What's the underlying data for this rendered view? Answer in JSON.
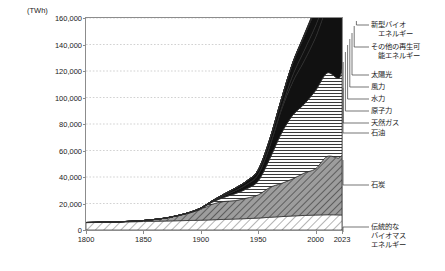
{
  "axis": {
    "unit_label": "(TWh)",
    "y_ticks": [
      "160,000",
      "140,000",
      "120,000",
      "100,000",
      "80,000",
      "60,000",
      "40,000",
      "20,000",
      "0"
    ],
    "x_ticks": [
      "1800",
      "1850",
      "1900",
      "1950",
      "2000",
      "2023"
    ]
  },
  "legend": {
    "items": [
      {
        "name": "new-bio-energy",
        "label": "新型バイオ\n　エネルギー"
      },
      {
        "name": "other-renewable-energy",
        "label": "その他の再生可\n　能エネルギー"
      },
      {
        "name": "solar",
        "label": "太陽光"
      },
      {
        "name": "wind",
        "label": "風力"
      },
      {
        "name": "hydro",
        "label": "水力"
      },
      {
        "name": "nuclear",
        "label": "原子力"
      },
      {
        "name": "natural-gas",
        "label": "天然ガス"
      },
      {
        "name": "oil",
        "label": "石油"
      },
      {
        "name": "coal",
        "label": "石炭"
      },
      {
        "name": "traditional-biomass",
        "label": "伝統的な\nバイオマス\nエネルギー"
      }
    ]
  },
  "chart_data": {
    "type": "area",
    "title": "",
    "xlabel": "",
    "ylabel": "(TWh)",
    "xlim": [
      1800,
      2023
    ],
    "ylim": [
      0,
      160000
    ],
    "ytick_values": [
      0,
      20000,
      40000,
      60000,
      80000,
      100000,
      120000,
      140000,
      160000
    ],
    "xtick_values": [
      1800,
      1850,
      1900,
      1950,
      2000,
      2023
    ],
    "grid": "horizontal-dotted",
    "legend_position": "right-outside",
    "stacked": true,
    "stack_order_bottom_to_top": [
      "伝統的なバイオマスエネルギー",
      "石炭",
      "石油",
      "天然ガス",
      "原子力",
      "水力",
      "風力",
      "太陽光",
      "その他の再生可能エネルギー",
      "新型バイオエネルギー"
    ],
    "x": [
      1800,
      1810,
      1820,
      1830,
      1840,
      1850,
      1860,
      1870,
      1880,
      1890,
      1900,
      1910,
      1920,
      1930,
      1940,
      1950,
      1960,
      1970,
      1980,
      1990,
      2000,
      2010,
      2020,
      2023
    ],
    "series": [
      {
        "name": "伝統的なバイオマスエネルギー",
        "values": [
          5560,
          5700,
          5850,
          6000,
          6200,
          6400,
          6600,
          6800,
          7000,
          7200,
          7400,
          7700,
          8000,
          8300,
          8600,
          9000,
          9600,
          10100,
          10600,
          11000,
          11300,
          11500,
          11400,
          11300
        ]
      },
      {
        "name": "石炭",
        "values": [
          97,
          130,
          180,
          260,
          420,
          750,
          1400,
          2300,
          3800,
          5600,
          8200,
          11800,
          13500,
          13900,
          15500,
          17500,
          22500,
          25000,
          28000,
          32000,
          35000,
          44000,
          43000,
          45500
        ]
      },
      {
        "name": "石油",
        "values": [
          0,
          0,
          0,
          0,
          0,
          0,
          5,
          30,
          110,
          280,
          600,
          1500,
          3100,
          5200,
          7000,
          10500,
          21500,
          37500,
          48000,
          52000,
          59000,
          63000,
          60000,
          65000
        ]
      },
      {
        "name": "天然ガス",
        "values": [
          0,
          0,
          0,
          0,
          0,
          0,
          0,
          5,
          25,
          80,
          200,
          500,
          1300,
          2300,
          3400,
          5000,
          9500,
          17500,
          25000,
          32500,
          40000,
          48000,
          52000,
          55000
        ]
      },
      {
        "name": "原子力",
        "values": [
          0,
          0,
          0,
          0,
          0,
          0,
          0,
          0,
          0,
          0,
          0,
          0,
          0,
          0,
          0,
          0,
          120,
          1000,
          5000,
          7800,
          8800,
          8500,
          7300,
          7400
        ]
      },
      {
        "name": "水力",
        "values": [
          0,
          0,
          0,
          0,
          0,
          0,
          0,
          0,
          30,
          90,
          220,
          600,
          1100,
          1900,
          2500,
          3400,
          5000,
          7000,
          9200,
          11000,
          12500,
          14500,
          16200,
          16700
        ]
      },
      {
        "name": "風力",
        "values": [
          0,
          0,
          0,
          0,
          0,
          0,
          0,
          0,
          0,
          0,
          0,
          0,
          0,
          0,
          0,
          0,
          0,
          0,
          10,
          100,
          800,
          4000,
          14500,
          18500
        ]
      },
      {
        "name": "太陽光",
        "values": [
          0,
          0,
          0,
          0,
          0,
          0,
          0,
          0,
          0,
          0,
          0,
          0,
          0,
          0,
          0,
          0,
          0,
          0,
          0,
          10,
          50,
          900,
          7800,
          14000
        ]
      },
      {
        "name": "その他の再生可能エネルギー",
        "values": [
          0,
          0,
          0,
          0,
          0,
          0,
          0,
          0,
          0,
          0,
          0,
          0,
          0,
          0,
          0,
          0,
          20,
          80,
          260,
          600,
          1100,
          2100,
          3600,
          4100
        ]
      },
      {
        "name": "新型バイオエネルギー",
        "values": [
          0,
          0,
          0,
          0,
          0,
          0,
          0,
          0,
          0,
          0,
          0,
          0,
          0,
          0,
          0,
          0,
          0,
          30,
          150,
          450,
          900,
          2300,
          4300,
          4800
        ]
      }
    ],
    "total_2023": 162000
  }
}
